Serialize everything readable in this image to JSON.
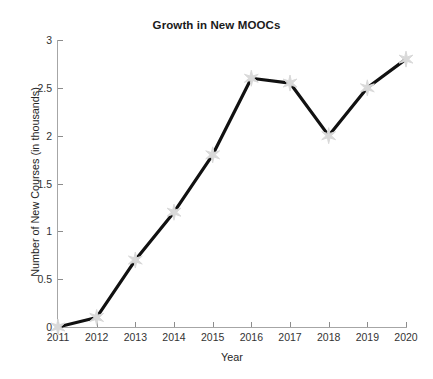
{
  "chart_data": {
    "type": "line",
    "title": "Growth in New MOOCs",
    "xlabel": "Year",
    "ylabel": "Number of New Courses (in thousands)",
    "categories": [
      2011,
      2012,
      2013,
      2014,
      2015,
      2016,
      2017,
      2018,
      2019,
      2020
    ],
    "x_tick_labels": [
      "2011",
      "2012",
      "2013",
      "2014",
      "2015",
      "2016",
      "2017",
      "2018",
      "2019",
      "2020"
    ],
    "values": [
      0.0,
      0.1,
      0.7,
      1.2,
      1.8,
      2.6,
      2.55,
      2.0,
      2.5,
      2.8
    ],
    "y_tick_labels": [
      "0",
      "0.5",
      "1",
      "1.5",
      "2",
      "2.5",
      "3"
    ],
    "y_ticks": [
      0,
      0.5,
      1,
      1.5,
      2,
      2.5,
      3
    ],
    "ylim": [
      0,
      3
    ],
    "xlim": [
      2011,
      2020
    ],
    "grid": false,
    "legend": false,
    "legend_position": "none",
    "line_color": "#111111",
    "marker": "hexagram-star",
    "marker_color": "#d9d9d9",
    "axis_color": "#a6a6a6",
    "background_color": "#ffffff"
  }
}
